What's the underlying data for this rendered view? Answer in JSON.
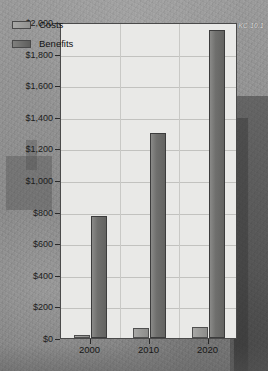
{
  "credit": "KC 10.1",
  "axis": {
    "ylabel": "Billions",
    "yticks": [
      "$2,000",
      "$1,800",
      "$1,600",
      "$1,400",
      "$1,200",
      "$1,000",
      "$800",
      "$600",
      "$400",
      "$200",
      "$0"
    ],
    "xticks": [
      "2000",
      "2010",
      "2020"
    ]
  },
  "legend": {
    "items": [
      {
        "label": "Costs",
        "color": "#97978f"
      },
      {
        "label": "Benefits",
        "color": "#66665f"
      }
    ]
  },
  "chart_data": {
    "type": "bar",
    "title": "",
    "xlabel": "",
    "ylabel": "Billions",
    "categories": [
      "2000",
      "2010",
      "2020"
    ],
    "series": [
      {
        "name": "Costs",
        "values": [
          20,
          65,
          70
        ],
        "color": "#97978f"
      },
      {
        "name": "Benefits",
        "values": [
          775,
          1300,
          1950
        ],
        "color": "#66665f"
      }
    ],
    "ylim": [
      0,
      2000
    ],
    "ytick_step": 200,
    "grid": true,
    "legend_position": "top-left",
    "annotations": [
      "KC 10.1"
    ]
  }
}
